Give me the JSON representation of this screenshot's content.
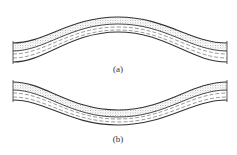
{
  "figure": {
    "panels": [
      {
        "id": "a",
        "label": "(a)",
        "shape": "anticline",
        "description": "Layered stratum bent upward into an arch"
      },
      {
        "id": "b",
        "label": "(b)",
        "shape": "syncline",
        "description": "Layered stratum bent downward into a trough"
      }
    ],
    "layers": [
      {
        "name": "upper-layer",
        "pattern": "dotted"
      },
      {
        "name": "lower-layer",
        "pattern": "dashed"
      }
    ],
    "colors": {
      "line": "#333333",
      "dots": "#9a9a9a",
      "dashes": "#555555",
      "background": "#ffffff"
    }
  }
}
